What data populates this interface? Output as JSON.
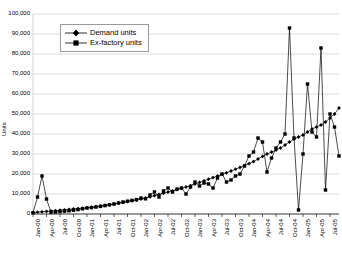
{
  "chart_data": {
    "type": "line",
    "title": "",
    "xlabel": "",
    "ylabel": "Units",
    "ylim": [
      0,
      100000
    ],
    "ytick_labels": [
      "0",
      "10,000",
      "20,000",
      "30,000",
      "40,000",
      "50,000",
      "60,000",
      "70,000",
      "80,000",
      "90,000",
      "100,000"
    ],
    "ytick_values": [
      0,
      10000,
      20000,
      30000,
      40000,
      50000,
      60000,
      70000,
      80000,
      90000,
      100000
    ],
    "grid": true,
    "legend_position": "upper-left",
    "x_tick_labels": [
      "Jan-00",
      "Apr-00",
      "Jul-00",
      "Oct-00",
      "Jan-01",
      "Apr-01",
      "Jul-01",
      "Oct-01",
      "Jan-02",
      "Apr-02",
      "Jul-02",
      "Oct-02",
      "Jan-03",
      "Apr-03",
      "Jul-03",
      "Oct-03",
      "Jan-04",
      "Apr-04",
      "Jul-04",
      "Oct-04",
      "Jan-05",
      "Apr-05",
      "Jul-05"
    ],
    "x_tick_indices": [
      0,
      3,
      6,
      9,
      12,
      15,
      18,
      21,
      24,
      27,
      30,
      33,
      36,
      39,
      42,
      45,
      48,
      51,
      54,
      57,
      60,
      63,
      66
    ],
    "n_points": 69,
    "series": [
      {
        "name": "Demand units",
        "marker": "diamond",
        "color": "#000000",
        "values": [
          700,
          900,
          1100,
          1300,
          1500,
          1700,
          1900,
          2100,
          2300,
          2500,
          2700,
          2900,
          3100,
          3400,
          3700,
          4000,
          4300,
          4600,
          5000,
          5400,
          5800,
          6200,
          6600,
          7000,
          7500,
          8000,
          8600,
          9200,
          9800,
          10400,
          11000,
          11600,
          12200,
          12800,
          13500,
          14200,
          15000,
          15800,
          16600,
          17400,
          18200,
          19000,
          19800,
          20600,
          21500,
          22400,
          23300,
          24200,
          25200,
          26200,
          27500,
          28800,
          30000,
          31000,
          32000,
          33000,
          34500,
          36000,
          37500,
          38500,
          39500,
          41000,
          42500,
          43500,
          44500,
          46000,
          48000,
          50000,
          53000
        ]
      },
      {
        "name": "Ex-factory units",
        "marker": "square",
        "color": "#000000",
        "values": [
          600,
          8500,
          19000,
          7500,
          900,
          1000,
          1200,
          1400,
          1600,
          1900,
          2200,
          2600,
          3000,
          3200,
          3500,
          3800,
          4200,
          4600,
          5000,
          5500,
          6000,
          6400,
          6800,
          7200,
          8000,
          7600,
          9500,
          11000,
          8500,
          11500,
          13000,
          11000,
          12500,
          13000,
          10000,
          13500,
          16000,
          14000,
          15500,
          15000,
          13000,
          18000,
          20000,
          16000,
          17000,
          19000,
          20000,
          24000,
          29000,
          31000,
          38000,
          36000,
          21000,
          28000,
          33000,
          36000,
          40000,
          39000,
          38000,
          35000,
          30000,
          39000,
          41000,
          38500,
          22000,
          12000,
          35000,
          43500,
          29000
        ]
      }
    ],
    "annotations": [
      {
        "label": "early spike",
        "index": 2,
        "value": 19000,
        "series": "Ex-factory units"
      },
      {
        "label": "peak spike",
        "index": 57,
        "value": 93000,
        "series": "Ex-factory units"
      },
      {
        "label": "deep dip",
        "index": 59,
        "value": 2000,
        "series": "Ex-factory units"
      },
      {
        "label": "late spike",
        "index": 64,
        "value": 83000,
        "series": "Ex-factory units"
      },
      {
        "label": "secondary spike",
        "index": 61,
        "value": 65000,
        "series": "Ex-factory units"
      },
      {
        "label": "mid spike",
        "index": 66,
        "value": 50000,
        "series": "Ex-factory units"
      }
    ]
  }
}
